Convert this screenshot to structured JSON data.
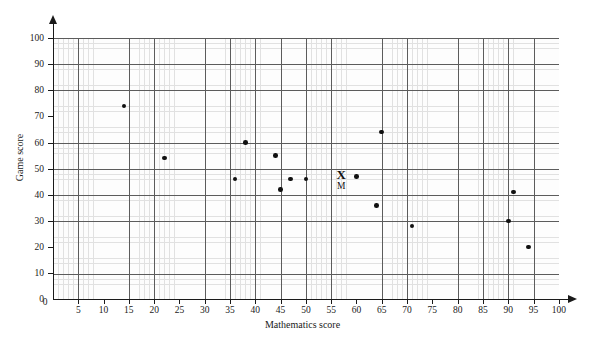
{
  "chart_data": {
    "type": "scatter",
    "title": "",
    "xlabel": "Mathematics score",
    "ylabel": "Game score",
    "xlim": [
      0,
      100
    ],
    "ylim": [
      0,
      100
    ],
    "grid": true,
    "legend": null,
    "x_ticks": [
      0,
      5,
      10,
      15,
      20,
      25,
      30,
      35,
      40,
      45,
      50,
      55,
      60,
      65,
      70,
      75,
      80,
      85,
      90,
      95,
      100
    ],
    "y_ticks": [
      0,
      10,
      20,
      30,
      40,
      50,
      60,
      70,
      80,
      90,
      100
    ],
    "x_major_step": 10,
    "y_major_step": 10,
    "x_minor_step": 1,
    "y_minor_step": 2,
    "points": [
      {
        "x": 14,
        "y": 74
      },
      {
        "x": 22,
        "y": 54
      },
      {
        "x": 36,
        "y": 46
      },
      {
        "x": 38,
        "y": 60
      },
      {
        "x": 44,
        "y": 55
      },
      {
        "x": 45,
        "y": 42
      },
      {
        "x": 47,
        "y": 46
      },
      {
        "x": 50,
        "y": 46
      },
      {
        "x": 60,
        "y": 47
      },
      {
        "x": 65,
        "y": 64
      },
      {
        "x": 64,
        "y": 36
      },
      {
        "x": 71,
        "y": 28
      },
      {
        "x": 91,
        "y": 41
      },
      {
        "x": 90,
        "y": 30
      },
      {
        "x": 94,
        "y": 20
      }
    ],
    "annotations": [
      {
        "name": "mean-point",
        "glyph": "X",
        "label": "M",
        "x": 57,
        "y": 48
      }
    ],
    "colors": {
      "point": "#111111",
      "axis": "#1a1a1a",
      "grid_major": "#5c5c5c",
      "grid_minor": "#d8d8d8",
      "background": "#ffffff"
    }
  }
}
